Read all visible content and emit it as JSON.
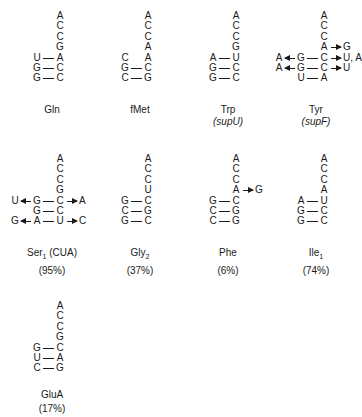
{
  "figure": {
    "panels": [
      {
        "id": "gln",
        "label": "Gln",
        "label_sub": "",
        "label_suffix": "",
        "subtitle": "",
        "subtitle_italic": false,
        "percent": "",
        "x": 0,
        "y": 0,
        "stem_col": [
          {
            "t": "A"
          },
          {
            "t": "C"
          },
          {
            "t": "C"
          },
          {
            "t": "G"
          },
          {
            "t": "A"
          },
          {
            "t": "C"
          },
          {
            "t": "C"
          }
        ],
        "pairs": [
          {
            "row": 4,
            "left": "U"
          },
          {
            "row": 5,
            "left": "G"
          },
          {
            "row": 6,
            "left": "G"
          }
        ],
        "unpaired_left": [],
        "arrows": []
      },
      {
        "id": "fmet",
        "label": "fMet",
        "label_sub": "",
        "label_suffix": "",
        "subtitle": "",
        "subtitle_italic": false,
        "percent": "",
        "x": 88,
        "y": 0,
        "stem_col": [
          {
            "t": "A"
          },
          {
            "t": "C"
          },
          {
            "t": "C"
          },
          {
            "t": "A"
          },
          {
            "t": "A"
          },
          {
            "t": "C"
          },
          {
            "t": "G"
          }
        ],
        "pairs": [
          {
            "row": 5,
            "left": "G"
          },
          {
            "row": 6,
            "left": "C"
          }
        ],
        "unpaired_left": [
          {
            "row": 4,
            "left": "C"
          }
        ],
        "arrows": []
      },
      {
        "id": "trp",
        "label": "Trp",
        "label_sub": "",
        "label_suffix": "",
        "subtitle": "(supU)",
        "subtitle_italic": true,
        "percent": "",
        "x": 176,
        "y": 0,
        "stem_col": [
          {
            "t": "A"
          },
          {
            "t": "C"
          },
          {
            "t": "C"
          },
          {
            "t": "G"
          },
          {
            "t": "U"
          },
          {
            "t": "C"
          },
          {
            "t": "C"
          }
        ],
        "pairs": [
          {
            "row": 4,
            "left": "A"
          },
          {
            "row": 5,
            "left": "G"
          },
          {
            "row": 6,
            "left": "G"
          }
        ],
        "unpaired_left": [],
        "arrows": []
      },
      {
        "id": "tyr",
        "label": "Tyr",
        "label_sub": "",
        "label_suffix": "",
        "subtitle": "(supF)",
        "subtitle_italic": true,
        "percent": "",
        "x": 264,
        "y": 0,
        "stem_col": [
          {
            "t": "A"
          },
          {
            "t": "C"
          },
          {
            "t": "C"
          },
          {
            "t": "A"
          },
          {
            "t": "C"
          },
          {
            "t": "C"
          },
          {
            "t": "A"
          }
        ],
        "pairs": [
          {
            "row": 4,
            "left": "G"
          },
          {
            "row": 5,
            "left": "G"
          },
          {
            "row": 6,
            "left": "U"
          }
        ],
        "unpaired_left": [],
        "arrows": [
          {
            "row": 3,
            "side": "right",
            "from": "A",
            "to": "G"
          },
          {
            "row": 4,
            "side": "right",
            "from": "C",
            "to": "U, A"
          },
          {
            "row": 4,
            "side": "left",
            "from": "G",
            "to": "A"
          },
          {
            "row": 5,
            "side": "right",
            "from": "C",
            "to": "U"
          },
          {
            "row": 5,
            "side": "left",
            "from": "G",
            "to": "A"
          }
        ]
      },
      {
        "id": "ser1",
        "label": "Ser",
        "label_sub": "1",
        "label_suffix": " (CUA)",
        "subtitle": "",
        "subtitle_italic": false,
        "percent": "(95%)",
        "x": 0,
        "y": 143,
        "stem_col": [
          {
            "t": "A"
          },
          {
            "t": "C"
          },
          {
            "t": "C"
          },
          {
            "t": "G"
          },
          {
            "t": "C"
          },
          {
            "t": "C"
          },
          {
            "t": "U"
          }
        ],
        "pairs": [
          {
            "row": 4,
            "left": "G"
          },
          {
            "row": 5,
            "left": "G"
          },
          {
            "row": 6,
            "left": "A"
          }
        ],
        "unpaired_left": [],
        "arrows": [
          {
            "row": 4,
            "side": "left",
            "from": "G",
            "to": "U"
          },
          {
            "row": 4,
            "side": "right",
            "from": "C",
            "to": "A"
          },
          {
            "row": 6,
            "side": "left",
            "from": "A",
            "to": "G"
          },
          {
            "row": 6,
            "side": "right",
            "from": "U",
            "to": "C"
          }
        ]
      },
      {
        "id": "gly2",
        "label": "Gly",
        "label_sub": "2",
        "label_suffix": "",
        "subtitle": "",
        "subtitle_italic": false,
        "percent": "(37%)",
        "x": 88,
        "y": 143,
        "stem_col": [
          {
            "t": "A"
          },
          {
            "t": "C"
          },
          {
            "t": "C"
          },
          {
            "t": "U"
          },
          {
            "t": "C"
          },
          {
            "t": "G"
          },
          {
            "t": "C"
          }
        ],
        "pairs": [
          {
            "row": 4,
            "left": "G"
          },
          {
            "row": 5,
            "left": "C"
          },
          {
            "row": 6,
            "left": "G"
          }
        ],
        "unpaired_left": [],
        "arrows": []
      },
      {
        "id": "phe",
        "label": "Phe",
        "label_sub": "",
        "label_suffix": "",
        "subtitle": "",
        "subtitle_italic": false,
        "percent": "(6%)",
        "x": 176,
        "y": 143,
        "stem_col": [
          {
            "t": "A"
          },
          {
            "t": "C"
          },
          {
            "t": "C"
          },
          {
            "t": "A"
          },
          {
            "t": "C"
          },
          {
            "t": "G"
          },
          {
            "t": "G"
          }
        ],
        "pairs": [
          {
            "row": 4,
            "left": "G"
          },
          {
            "row": 5,
            "left": "C"
          },
          {
            "row": 6,
            "left": "C"
          }
        ],
        "unpaired_left": [],
        "arrows": [
          {
            "row": 3,
            "side": "right",
            "from": "A",
            "to": "G"
          }
        ]
      },
      {
        "id": "ile1",
        "label": "Ile",
        "label_sub": "1",
        "label_suffix": "",
        "subtitle": "",
        "subtitle_italic": false,
        "percent": "(74%)",
        "x": 264,
        "y": 143,
        "stem_col": [
          {
            "t": "A"
          },
          {
            "t": "C"
          },
          {
            "t": "C"
          },
          {
            "t": "A"
          },
          {
            "t": "U"
          },
          {
            "t": "C"
          },
          {
            "t": "C"
          }
        ],
        "pairs": [
          {
            "row": 4,
            "left": "A"
          },
          {
            "row": 5,
            "left": "G"
          },
          {
            "row": 6,
            "left": "G"
          }
        ],
        "unpaired_left": [],
        "arrows": []
      },
      {
        "id": "glua",
        "label": "GluA",
        "label_sub": "",
        "label_suffix": "",
        "subtitle": "",
        "subtitle_italic": false,
        "percent": "(17%)",
        "x": 0,
        "y": 290,
        "stem_col": [
          {
            "t": "A"
          },
          {
            "t": "C"
          },
          {
            "t": "C"
          },
          {
            "t": "G"
          },
          {
            "t": "C"
          },
          {
            "t": "A"
          },
          {
            "t": "G"
          }
        ],
        "pairs": [
          {
            "row": 4,
            "left": "G"
          },
          {
            "row": 5,
            "left": "U"
          },
          {
            "row": 6,
            "left": "C"
          }
        ],
        "unpaired_left": [],
        "arrows": []
      }
    ]
  }
}
